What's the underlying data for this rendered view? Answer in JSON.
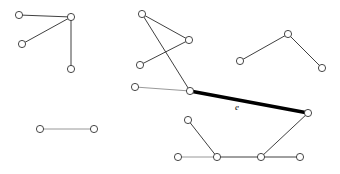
{
  "figure": {
    "type": "node-link-diagram",
    "width": 340,
    "height": 174,
    "background_color": "#ffffff"
  },
  "styles": {
    "edge_color": "#2a2a2a",
    "edge_faint_color": "#8d8d8d",
    "highlight_color": "#000000",
    "vertex_fill": "#ffffff",
    "vertex_stroke": "#333333",
    "vertex_radius": 3.6,
    "edge_width": 0.9,
    "highlight_width": 3.4
  },
  "labels": [
    {
      "id": "label-e",
      "text": "e",
      "x": 237,
      "y": 110,
      "style": "italic"
    }
  ],
  "components": [
    {
      "id": "component-top-left",
      "name": "top-left-star",
      "vertices": [
        {
          "id": "v1",
          "x": 19,
          "y": 15
        },
        {
          "id": "v2",
          "x": 71,
          "y": 17
        },
        {
          "id": "v3",
          "x": 22,
          "y": 44
        },
        {
          "id": "v4",
          "x": 71,
          "y": 69
        }
      ],
      "edges": [
        {
          "id": "e1",
          "from": "v1",
          "to": "v2",
          "weight": "normal"
        },
        {
          "id": "e2",
          "from": "v3",
          "to": "v2",
          "weight": "normal"
        },
        {
          "id": "e3",
          "from": "v2",
          "to": "v4",
          "weight": "normal"
        }
      ]
    },
    {
      "id": "component-right-path",
      "name": "right-path",
      "vertices": [
        {
          "id": "v5",
          "x": 240,
          "y": 61
        },
        {
          "id": "v6",
          "x": 288,
          "y": 34
        },
        {
          "id": "v7",
          "x": 322,
          "y": 68
        }
      ],
      "edges": [
        {
          "id": "e4",
          "from": "v5",
          "to": "v6",
          "weight": "normal"
        },
        {
          "id": "e5",
          "from": "v6",
          "to": "v7",
          "weight": "normal"
        }
      ]
    },
    {
      "id": "component-bottom-left",
      "name": "isolated-edge",
      "vertices": [
        {
          "id": "v8",
          "x": 40,
          "y": 129
        },
        {
          "id": "v9",
          "x": 94,
          "y": 129
        }
      ],
      "edges": [
        {
          "id": "e6",
          "from": "v8",
          "to": "v9",
          "weight": "faint"
        }
      ]
    },
    {
      "id": "component-main",
      "name": "main-component",
      "vertices": [
        {
          "id": "v10",
          "x": 142,
          "y": 14
        },
        {
          "id": "v11",
          "x": 189,
          "y": 40
        },
        {
          "id": "v12",
          "x": 140,
          "y": 65
        },
        {
          "id": "v13",
          "x": 135,
          "y": 87
        },
        {
          "id": "v14",
          "x": 190,
          "y": 91
        },
        {
          "id": "v15",
          "x": 308,
          "y": 113
        },
        {
          "id": "v16",
          "x": 188,
          "y": 120
        },
        {
          "id": "v17",
          "x": 178,
          "y": 157
        },
        {
          "id": "v18",
          "x": 217,
          "y": 157
        },
        {
          "id": "v19",
          "x": 261,
          "y": 157
        },
        {
          "id": "v20",
          "x": 300,
          "y": 157
        }
      ],
      "edges": [
        {
          "id": "e7",
          "from": "v10",
          "to": "v11",
          "weight": "normal"
        },
        {
          "id": "e8",
          "from": "v10",
          "to": "v14",
          "weight": "normal"
        },
        {
          "id": "e9",
          "from": "v11",
          "to": "v12",
          "weight": "normal"
        },
        {
          "id": "e10",
          "from": "v13",
          "to": "v14",
          "weight": "faint"
        },
        {
          "id": "e11",
          "from": "v14",
          "to": "v15",
          "weight": "highlight",
          "label": "e"
        },
        {
          "id": "e12",
          "from": "v15",
          "to": "v19",
          "weight": "normal"
        },
        {
          "id": "e13",
          "from": "v16",
          "to": "v18",
          "weight": "normal"
        },
        {
          "id": "e14",
          "from": "v17",
          "to": "v18",
          "weight": "faint"
        },
        {
          "id": "e15",
          "from": "v18",
          "to": "v19",
          "weight": "normal"
        },
        {
          "id": "e16",
          "from": "v19",
          "to": "v20",
          "weight": "normal"
        }
      ]
    }
  ]
}
